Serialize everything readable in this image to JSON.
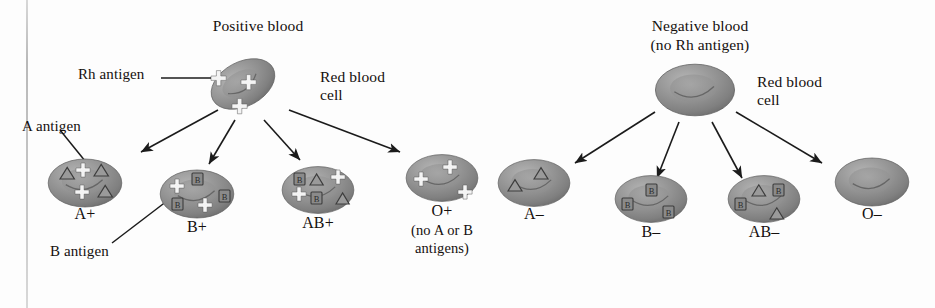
{
  "figure": {
    "title_positive": "Positive blood",
    "title_negative_line1": "Negative blood",
    "title_negative_line2": "(no Rh antigen)",
    "rbc_label_line1": "Red blood",
    "rbc_label_line2": "cell",
    "rbc_label_line1_b": "Red blood",
    "rbc_label_line2_b": "cell",
    "annotation_rh": "Rh antigen",
    "annotation_a": "A antigen",
    "annotation_b": "B antigen",
    "note_o_line1": "(no A or B",
    "note_o_line2": "antigens)",
    "colors": {
      "cell_fill": "#8e8e8e",
      "cell_fill_light": "#a8a8a8",
      "cell_fill_dark": "#6f6f6f",
      "ink": "#15100e",
      "rule": "#c4c4c4",
      "background": "#fdfdfd",
      "marker_plus": "#f2f2f2",
      "marker_outline": "#3a3a3a"
    }
  },
  "groups": [
    {
      "id": "positive",
      "name": "Positive blood",
      "parent_cell": {
        "name": "parent-red-blood-cell-positive",
        "markers": {
          "plus": 3,
          "triangle": 0,
          "square_b": 0
        }
      },
      "children": [
        {
          "id": "a-plus",
          "label": "A+",
          "markers": {
            "plus": 2,
            "triangle": 3,
            "square_b": 0
          }
        },
        {
          "id": "b-plus",
          "label": "B+",
          "markers": {
            "plus": 2,
            "triangle": 0,
            "square_b": 3
          }
        },
        {
          "id": "ab-plus",
          "label": "AB+",
          "markers": {
            "plus": 2,
            "triangle": 2,
            "square_b": 2
          }
        },
        {
          "id": "o-plus",
          "label": "O+",
          "markers": {
            "plus": 3,
            "triangle": 0,
            "square_b": 0
          }
        }
      ]
    },
    {
      "id": "negative",
      "name": "Negative blood (no Rh antigen)",
      "parent_cell": {
        "name": "parent-red-blood-cell-negative",
        "markers": {
          "plus": 0,
          "triangle": 0,
          "square_b": 0
        }
      },
      "children": [
        {
          "id": "a-minus",
          "label": "A–",
          "markers": {
            "plus": 0,
            "triangle": 2,
            "square_b": 0
          }
        },
        {
          "id": "b-minus",
          "label": "B–",
          "markers": {
            "plus": 0,
            "triangle": 0,
            "square_b": 3
          }
        },
        {
          "id": "ab-minus",
          "label": "AB–",
          "markers": {
            "plus": 0,
            "triangle": 2,
            "square_b": 2
          }
        },
        {
          "id": "o-minus",
          "label": "O–",
          "markers": {
            "plus": 0,
            "triangle": 0,
            "square_b": 0
          }
        }
      ]
    }
  ],
  "icons": {
    "plus": "plus-marker-icon",
    "triangle": "triangle-a-antigen-icon",
    "square_b": "square-b-antigen-icon",
    "cell": "red-blood-cell-icon",
    "arrow": "arrow-icon",
    "leader": "leader-line-icon"
  }
}
